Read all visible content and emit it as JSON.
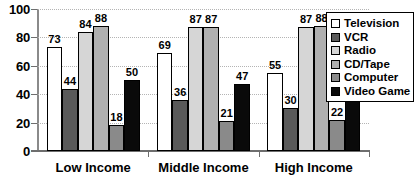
{
  "chart_data": {
    "type": "bar",
    "title": "",
    "xlabel": "",
    "ylabel": "",
    "ylim": [
      0,
      100
    ],
    "yticks": [
      0,
      20,
      40,
      60,
      80,
      100
    ],
    "grid": true,
    "legend_position": "right",
    "categories": [
      "Low Income",
      "Middle Income",
      "High Income"
    ],
    "series": [
      {
        "name": "Television",
        "values": [
          73,
          69,
          55
        ],
        "color": "#ffffff"
      },
      {
        "name": "VCR",
        "values": [
          44,
          36,
          30
        ],
        "color": "#5a5a5a"
      },
      {
        "name": "Radio",
        "values": [
          84,
          87,
          87
        ],
        "color": "#d6d6d6"
      },
      {
        "name": "CD/Tape",
        "values": [
          88,
          87,
          88
        ],
        "color": "#b0b0b0"
      },
      {
        "name": "Computer",
        "values": [
          18,
          21,
          22
        ],
        "color": "#8a8a8a"
      },
      {
        "name": "Video Game",
        "values": [
          50,
          47,
          39
        ],
        "color": "#0a0a0a"
      }
    ]
  },
  "axis": {
    "y_tick_labels": [
      "100",
      "80",
      "60",
      "40",
      "20",
      "0"
    ]
  },
  "legend": {
    "items": [
      {
        "label": "Television"
      },
      {
        "label": "VCR"
      },
      {
        "label": "Radio"
      },
      {
        "label": "CD/Tape"
      },
      {
        "label": "Computer"
      },
      {
        "label": "Video Game"
      }
    ]
  }
}
